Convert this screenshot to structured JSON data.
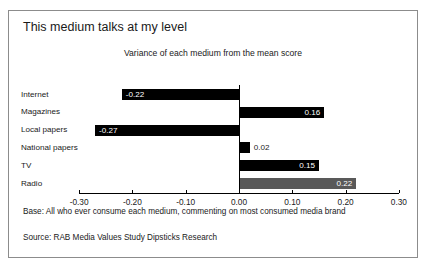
{
  "title": "This medium talks at my level",
  "subtitle": "Variance of each medium from the mean score",
  "notes": {
    "base": "Base: All who ever consume each medium, commenting on most consumed media brand",
    "source": "Source: RAB Media Values Study Dipsticks Research"
  },
  "colors": {
    "bar_default": "#000000",
    "bar_highlight": "#595959",
    "border": "#8c8c8c",
    "text": "#1a1a1a",
    "background": "#ffffff"
  },
  "chart_data": {
    "type": "bar",
    "orientation": "horizontal",
    "title": "This medium talks at my level",
    "subtitle": "Variance of each medium from the mean score",
    "xlabel": "",
    "ylabel": "",
    "xlim": [
      -0.3,
      0.3
    ],
    "grid": false,
    "legend": null,
    "tick_labels": [
      "-0.30",
      "-0.20",
      "-0.10",
      "0.00",
      "0.10",
      "0.20",
      "0.30"
    ],
    "ticks": [
      -0.3,
      -0.2,
      -0.1,
      0.0,
      0.1,
      0.2,
      0.3
    ],
    "categories": [
      "Internet",
      "Magazines",
      "Local papers",
      "National papers",
      "TV",
      "Radio"
    ],
    "values": [
      -0.22,
      0.16,
      -0.27,
      0.02,
      0.15,
      0.22
    ],
    "data_labels": [
      "-0.22",
      "0.16",
      "-0.27",
      "0.02",
      "0.15",
      "0.22"
    ],
    "bar_colors": [
      "#000000",
      "#000000",
      "#000000",
      "#000000",
      "#000000",
      "#595959"
    ]
  }
}
